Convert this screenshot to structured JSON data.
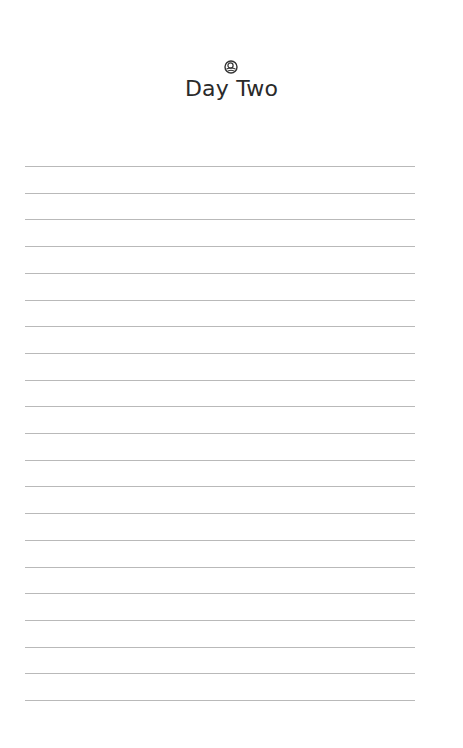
{
  "page": {
    "ornament_icon": "swirl-ornament-icon",
    "title": "Day Two",
    "ruled_lines": {
      "count": 21,
      "first_y": 166,
      "spacing": 26.7,
      "color": "#b9b9b9"
    }
  }
}
